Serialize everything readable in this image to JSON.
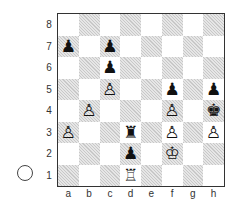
{
  "board": {
    "ranks": [
      "8",
      "7",
      "6",
      "5",
      "4",
      "3",
      "2",
      "1"
    ],
    "files": [
      "a",
      "b",
      "c",
      "d",
      "e",
      "f",
      "g",
      "h"
    ],
    "pieces": {
      "a7": {
        "glyph": "♟",
        "name": "black-pawn"
      },
      "c7": {
        "glyph": "♟",
        "name": "black-pawn"
      },
      "c6": {
        "glyph": "♟",
        "name": "black-pawn"
      },
      "c5": {
        "glyph": "♙",
        "name": "white-pawn"
      },
      "f5": {
        "glyph": "♟",
        "name": "black-pawn"
      },
      "h5": {
        "glyph": "♟",
        "name": "black-pawn"
      },
      "b4": {
        "glyph": "♙",
        "name": "white-pawn"
      },
      "f4": {
        "glyph": "♙",
        "name": "white-pawn"
      },
      "h4": {
        "glyph": "♚",
        "name": "black-king"
      },
      "a3": {
        "glyph": "♙",
        "name": "white-pawn"
      },
      "d3": {
        "glyph": "♜",
        "name": "black-rook"
      },
      "f3": {
        "glyph": "♙",
        "name": "white-pawn"
      },
      "h3": {
        "glyph": "♙",
        "name": "white-pawn"
      },
      "d2": {
        "glyph": "♟",
        "name": "black-pawn"
      },
      "f2": {
        "glyph": "♔",
        "name": "white-king"
      },
      "d1": {
        "glyph": "♖",
        "name": "white-rook"
      }
    }
  },
  "side_to_move": "white",
  "colors": {
    "light_square": "#ffffff",
    "dark_square_hatch": "#c8c8c8",
    "border": "#333333"
  }
}
